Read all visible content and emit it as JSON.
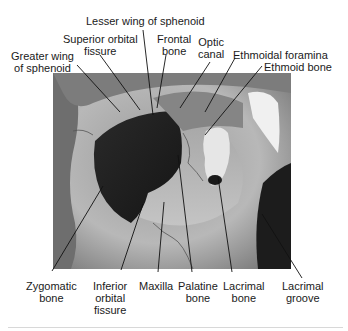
{
  "figure": {
    "labels_top": [
      {
        "id": "lesser-wing",
        "lines": [
          "Lesser wing of sphenoid"
        ]
      },
      {
        "id": "superior-orbital-fissure",
        "lines": [
          "Superior orbital",
          "fissure"
        ]
      },
      {
        "id": "greater-wing",
        "lines": [
          "Greater wing",
          "of sphenoid"
        ]
      },
      {
        "id": "frontal-bone",
        "lines": [
          "Frontal",
          "bone"
        ]
      },
      {
        "id": "optic-canal",
        "lines": [
          "Optic",
          "canal"
        ]
      },
      {
        "id": "ethmoidal-foramina",
        "lines": [
          "Ethmoidal foramina"
        ]
      },
      {
        "id": "ethmoid-bone",
        "lines": [
          "Ethmoid bone"
        ]
      }
    ],
    "labels_bottom": [
      {
        "id": "zygomatic-bone",
        "lines": [
          "Zygomatic",
          "bone"
        ]
      },
      {
        "id": "inferior-orbital-fissure",
        "lines": [
          "Inferior",
          "orbital",
          "fissure"
        ]
      },
      {
        "id": "maxilla",
        "lines": [
          "Maxilla"
        ]
      },
      {
        "id": "palatine-bone",
        "lines": [
          "Palatine",
          "bone"
        ]
      },
      {
        "id": "lacrimal-bone",
        "lines": [
          "Lacrimal",
          "bone"
        ]
      },
      {
        "id": "lacrimal-groove",
        "lines": [
          "Lacrimal",
          "groove"
        ]
      }
    ],
    "colors": {
      "background": "#ffffff",
      "text": "#1a1a1a",
      "leader_line": "#111111",
      "photo_mid": "#8a8a8a",
      "orbit_dark": "#1e1e1e"
    }
  }
}
